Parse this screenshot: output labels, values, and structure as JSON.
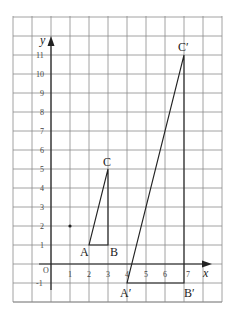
{
  "diagram": {
    "axes": {
      "x_label": "x",
      "y_label": "y",
      "origin_label": "O",
      "x_ticks": [
        "1",
        "2",
        "3",
        "4",
        "5",
        "6",
        "7"
      ],
      "y_ticks": [
        "-1",
        "1",
        "2",
        "3",
        "4",
        "5",
        "6",
        "7",
        "8",
        "9",
        "10",
        "11"
      ]
    },
    "grid": {
      "x_range": [
        -2,
        9
      ],
      "y_range": [
        -2,
        13
      ]
    },
    "center_point": {
      "x": 1,
      "y": 2
    },
    "triangle_small": {
      "A": {
        "label": "A",
        "x": 2,
        "y": 1
      },
      "B": {
        "label": "B",
        "x": 3,
        "y": 1
      },
      "C": {
        "label": "C",
        "x": 3,
        "y": 5
      }
    },
    "triangle_large": {
      "A": {
        "label": "A′",
        "x": 4,
        "y": -1
      },
      "B": {
        "label": "B′",
        "x": 7,
        "y": -1
      },
      "C": {
        "label": "C′",
        "x": 7,
        "y": 11
      }
    },
    "colors": {
      "grid": "#8a8a8a",
      "lines": "#222222"
    }
  }
}
